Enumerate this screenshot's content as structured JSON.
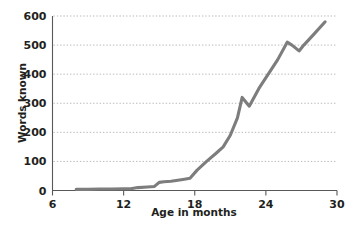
{
  "chart_data": {
    "type": "line",
    "title": "",
    "xlabel": "Age in months",
    "ylabel": "Words known",
    "xlim": [
      6,
      30
    ],
    "ylim": [
      0,
      600
    ],
    "xticks": [
      6,
      12,
      18,
      24,
      30
    ],
    "yticks": [
      0,
      100,
      200,
      300,
      400,
      500,
      600
    ],
    "xtick_labels": [
      "6",
      "12",
      "18",
      "24",
      "30"
    ],
    "ytick_labels": [
      "0",
      "100",
      "200",
      "300",
      "400",
      "500",
      "600"
    ],
    "grid": "horizontal-dotted",
    "legend": "none",
    "series": [
      {
        "name": "Words known",
        "color": "#7d7d7d",
        "x": [
          8.0,
          9.0,
          10.0,
          11.0,
          12.0,
          12.6,
          13.2,
          14.0,
          14.6,
          15.0,
          15.4,
          16.0,
          17.0,
          17.6,
          18.2,
          19.0,
          19.8,
          20.4,
          21.0,
          21.6,
          22.0,
          22.6,
          23.4,
          24.2,
          25.0,
          25.8,
          26.2,
          26.8,
          27.2,
          28.0,
          29.0
        ],
        "y": [
          4,
          4,
          5,
          5,
          6,
          6,
          10,
          12,
          14,
          28,
          30,
          32,
          38,
          42,
          70,
          100,
          128,
          150,
          190,
          250,
          320,
          290,
          350,
          400,
          450,
          510,
          500,
          480,
          500,
          535,
          580
        ]
      }
    ]
  },
  "axis": {
    "x_title": "Age in months",
    "y_title": "Words known"
  }
}
